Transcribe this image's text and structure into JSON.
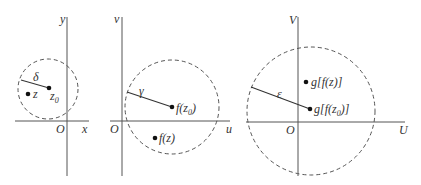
{
  "diagram": {
    "panels": [
      {
        "name": "z-plane",
        "axes": {
          "horizontal": "x",
          "vertical": "y",
          "origin": "O"
        },
        "radius_label": "δ",
        "center_point": {
          "label": "z",
          "subscript": "0"
        },
        "other_point": {
          "label": "z"
        }
      },
      {
        "name": "w-plane",
        "axes": {
          "horizontal": "u",
          "vertical": "v",
          "origin": "O"
        },
        "radius_label": "γ",
        "center_point": {
          "label": "f(z",
          "subscript": "0",
          "suffix": ")"
        },
        "other_point": {
          "label": "f(z)"
        }
      },
      {
        "name": "W-plane",
        "axes": {
          "horizontal": "U",
          "vertical": "V",
          "origin": "O"
        },
        "radius_label": "ε",
        "center_point": {
          "label": "g[f(z",
          "subscript": "0",
          "suffix": ")]"
        },
        "other_point": {
          "label": "g[f(z)]"
        }
      }
    ]
  }
}
